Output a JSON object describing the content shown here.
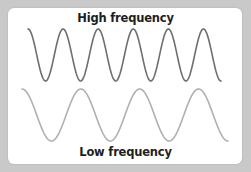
{
  "diagram": {
    "title_top": "High frequency",
    "title_bottom": "Low frequency",
    "background_color": "#c9c9c9",
    "card_color": "#ffffff",
    "waves": [
      {
        "name": "high-frequency-wave",
        "color": "#6e6e6e",
        "x_start": 28,
        "x_end": 221,
        "y_top": 29,
        "y_bottom": 81,
        "cycles": 5.5
      },
      {
        "name": "low-frequency-wave",
        "color": "#b0b0b0",
        "x_start": 22,
        "x_end": 228,
        "y_top": 89,
        "y_bottom": 141,
        "cycles": 3.5
      }
    ]
  }
}
